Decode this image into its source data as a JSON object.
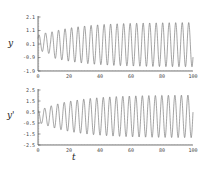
{
  "chart_data": [
    {
      "type": "line",
      "title": "",
      "xlabel": "",
      "ylabel": "y",
      "xlim": [
        0,
        100
      ],
      "ylim": [
        -1.9,
        2.1
      ],
      "xticks": [
        "0",
        "20",
        "40",
        "60",
        "80",
        "100"
      ],
      "yticks": [
        "2.1",
        "1.1",
        "0.1",
        "-0.9",
        "-1.9"
      ],
      "grid": false,
      "description": "Oscillation with growing amplitude; starts near 0.6, early peaks ~0.9, settles to steady oscillation between about -1.6 and 1.7 with period ~4.2",
      "series": [
        {
          "name": "y",
          "amplitude_start": 0.6,
          "amplitude_end": 1.65,
          "offset": 0.05,
          "period": 4.2
        }
      ]
    },
    {
      "type": "line",
      "title": "",
      "xlabel": "t",
      "ylabel": "y'",
      "xlim": [
        0,
        100
      ],
      "ylim": [
        -2.5,
        2.5
      ],
      "xticks": [
        "0",
        "20",
        "40",
        "60",
        "80",
        "100"
      ],
      "yticks": [
        "2.5",
        "1.5",
        "0.5",
        "-0.5",
        "-1.5",
        "-2.5"
      ],
      "grid": false,
      "description": "Derivative oscillation; starts small (~0.5 amplitude), grows to steady oscillation between about -1.8 and 2.1 with period ~4.2",
      "series": [
        {
          "name": "y'",
          "amplitude_start": 0.5,
          "amplitude_end": 1.95,
          "offset": 0.1,
          "period": 4.2
        }
      ]
    }
  ]
}
